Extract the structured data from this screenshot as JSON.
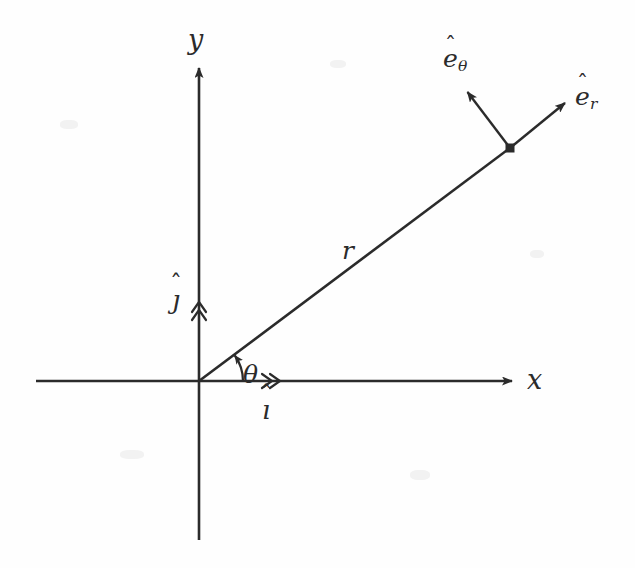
{
  "figure": {
    "type": "diagram",
    "background_color": "#fefefe",
    "ink_color": "#2b2b2b",
    "width": 635,
    "height": 568
  },
  "axes": {
    "origin": {
      "x": 199,
      "y": 381
    },
    "x_axis": {
      "label": "x",
      "start": {
        "x": 36,
        "y": 381
      },
      "end": {
        "x": 518,
        "y": 381
      },
      "arrow": "single"
    },
    "y_axis": {
      "label": "y",
      "start": {
        "x": 199,
        "y": 540
      },
      "end": {
        "x": 199,
        "y": 62
      },
      "arrow": "single"
    }
  },
  "point": {
    "name": "position-point",
    "x": 510,
    "y": 148,
    "marker": "filled-square"
  },
  "radial_line": {
    "label": "r",
    "from": {
      "x": 199,
      "y": 381
    },
    "to": {
      "x": 510,
      "y": 148
    },
    "angle_degrees": 36.8
  },
  "angle": {
    "label": "θ",
    "arc_radius": 44,
    "from_degrees": 0,
    "to_degrees": 36.8,
    "arrow": "counterclockwise"
  },
  "cartesian_unit_vectors": [
    {
      "label_base": "ê",
      "label": "i",
      "hat": "ˆ",
      "axis": "x",
      "marker": "double-chevron",
      "marker_position": {
        "x": 272,
        "y": 381
      }
    },
    {
      "label": "j",
      "hat": "ˆ",
      "axis": "y",
      "marker": "double-chevron",
      "marker_position": {
        "x": 199,
        "y": 306
      }
    }
  ],
  "polar_unit_vectors": [
    {
      "label": "e",
      "hat": "ˆ",
      "subscript": "r",
      "from": {
        "x": 510,
        "y": 148
      },
      "to": {
        "x": 568,
        "y": 100
      },
      "arrow": "single"
    },
    {
      "label": "e",
      "hat": "ˆ",
      "subscript": "θ",
      "from": {
        "x": 510,
        "y": 148
      },
      "to": {
        "x": 465,
        "y": 88
      },
      "arrow": "single"
    }
  ],
  "labels": {
    "y": "y",
    "x": "x",
    "r": "r",
    "theta": "θ",
    "i_base": "ı",
    "i_hat": "ˆ",
    "j_base": "ȷ",
    "j_hat": "ˆ",
    "e_base": "e",
    "e_hat": "ˆ",
    "er_sub": "r",
    "etheta_sub": "θ"
  }
}
